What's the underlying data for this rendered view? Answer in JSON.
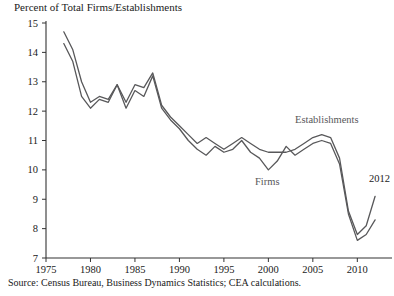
{
  "figure": {
    "title": "Percent of Total Firms/Establishments",
    "source_note": "Source: Census Bureau, Business Dynamics Statistics; CEA calculations.",
    "line_color": "#58585a",
    "axis_color": "#333333",
    "background": "#ffffff"
  },
  "annotations": {
    "establishments_label": "Establishments",
    "firms_label": "Firms",
    "endpoint_label": "2012"
  },
  "chart_data": {
    "type": "line",
    "title": "Percent of Total Firms/Establishments",
    "subtitle": "",
    "xlabel": "",
    "ylabel": "Percent of Total Firms/Establishments",
    "xlim": [
      1975,
      2013
    ],
    "ylim": [
      7,
      15
    ],
    "yticks": [
      7,
      8,
      9,
      10,
      11,
      12,
      13,
      14,
      15
    ],
    "ytick_labels": [
      "7",
      "8",
      "9",
      "10",
      "11",
      "12",
      "13",
      "14",
      "15"
    ],
    "xticks": [
      1975,
      1980,
      1985,
      1990,
      1995,
      2000,
      2005,
      2010
    ],
    "xtick_labels": [
      "1975",
      "1980",
      "1985",
      "1990",
      "1995",
      "2000",
      "2005",
      "2010"
    ],
    "grid": false,
    "legend": "inline-annotations",
    "x": [
      1977,
      1978,
      1979,
      1980,
      1981,
      1982,
      1983,
      1984,
      1985,
      1986,
      1987,
      1988,
      1989,
      1990,
      1991,
      1992,
      1993,
      1994,
      1995,
      1996,
      1997,
      1998,
      1999,
      2000,
      2001,
      2002,
      2003,
      2004,
      2005,
      2006,
      2007,
      2008,
      2009,
      2010,
      2011,
      2012
    ],
    "series": [
      {
        "name": "Establishments",
        "values": [
          14.7,
          14.1,
          13.0,
          12.3,
          12.5,
          12.4,
          12.9,
          12.3,
          12.9,
          12.8,
          13.3,
          12.2,
          11.8,
          11.5,
          11.2,
          10.9,
          11.1,
          10.9,
          10.7,
          10.9,
          11.1,
          10.9,
          10.7,
          10.6,
          10.6,
          10.6,
          10.7,
          10.9,
          11.1,
          11.2,
          11.1,
          10.4,
          8.6,
          7.8,
          8.1,
          9.1
        ]
      },
      {
        "name": "Firms",
        "values": [
          14.3,
          13.7,
          12.5,
          12.1,
          12.4,
          12.3,
          12.9,
          12.1,
          12.7,
          12.5,
          13.2,
          12.1,
          11.7,
          11.4,
          11.0,
          10.7,
          10.5,
          10.8,
          10.6,
          10.7,
          11.0,
          10.6,
          10.4,
          10.0,
          10.3,
          10.8,
          10.5,
          10.7,
          10.9,
          11.0,
          10.9,
          10.2,
          8.5,
          7.6,
          7.8,
          8.3
        ]
      }
    ],
    "annotations": [
      {
        "text": "Establishments",
        "x": 2003,
        "y": 11.6
      },
      {
        "text": "Firms",
        "x": 1998.5,
        "y": 9.5
      },
      {
        "text": "2012",
        "x": 2012.5,
        "y": 9.6
      }
    ]
  }
}
